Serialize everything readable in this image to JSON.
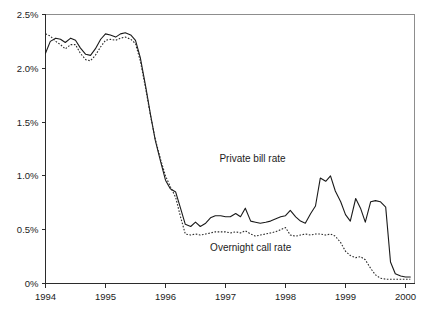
{
  "chart_data": {
    "type": "line",
    "title": "",
    "subtitle": "",
    "xlabel": "",
    "ylabel": "",
    "xlim": [
      1994.0,
      2000.15
    ],
    "ylim": [
      0,
      2.5
    ],
    "grid": false,
    "legend_position": "inline-annotation",
    "y_tick_labels": [
      "2.5%",
      "2.0%",
      "1.5%",
      "1.0%",
      "0.5%",
      "0%"
    ],
    "y_tick_values": [
      2.5,
      2.0,
      1.5,
      1.0,
      0.5,
      0.0
    ],
    "x_tick_labels": [
      "1994",
      "1995",
      "1996",
      "1997",
      "1998",
      "1999",
      "2000"
    ],
    "x_tick_values": [
      1994,
      1995,
      1996,
      1997,
      1998,
      1999,
      2000
    ],
    "annotations": [
      {
        "text": "Private bill rate",
        "x": 1997.45,
        "y": 1.13
      },
      {
        "text": "Overnight call rate",
        "x": 1997.42,
        "y": 0.3
      }
    ],
    "series": [
      {
        "name": "Private bill rate",
        "style": "solid",
        "x": [
          1994.0,
          1994.08,
          1994.17,
          1994.25,
          1994.33,
          1994.42,
          1994.5,
          1994.58,
          1994.67,
          1994.75,
          1994.83,
          1994.92,
          1995.0,
          1995.08,
          1995.17,
          1995.25,
          1995.33,
          1995.42,
          1995.5,
          1995.58,
          1995.67,
          1995.75,
          1995.83,
          1995.92,
          1996.0,
          1996.08,
          1996.17,
          1996.25,
          1996.33,
          1996.42,
          1996.5,
          1996.58,
          1996.67,
          1996.75,
          1996.83,
          1996.92,
          1997.0,
          1997.08,
          1997.17,
          1997.25,
          1997.33,
          1997.42,
          1997.5,
          1997.58,
          1997.67,
          1997.75,
          1997.83,
          1997.92,
          1998.0,
          1998.08,
          1998.17,
          1998.25,
          1998.33,
          1998.42,
          1998.5,
          1998.58,
          1998.67,
          1998.75,
          1998.83,
          1998.92,
          1999.0,
          1999.08,
          1999.17,
          1999.25,
          1999.33,
          1999.42,
          1999.5,
          1999.58,
          1999.67,
          1999.75,
          1999.83,
          1999.92,
          2000.0,
          2000.08
        ],
        "y": [
          2.14,
          2.25,
          2.28,
          2.27,
          2.24,
          2.28,
          2.26,
          2.19,
          2.13,
          2.12,
          2.18,
          2.27,
          2.32,
          2.31,
          2.29,
          2.32,
          2.33,
          2.31,
          2.26,
          2.1,
          1.83,
          1.57,
          1.33,
          1.13,
          0.96,
          0.88,
          0.85,
          0.7,
          0.55,
          0.53,
          0.57,
          0.53,
          0.56,
          0.61,
          0.63,
          0.63,
          0.62,
          0.62,
          0.65,
          0.62,
          0.7,
          0.58,
          0.57,
          0.56,
          0.57,
          0.58,
          0.6,
          0.62,
          0.63,
          0.68,
          0.62,
          0.58,
          0.56,
          0.65,
          0.72,
          0.98,
          0.95,
          1.0,
          0.86,
          0.76,
          0.64,
          0.58,
          0.79,
          0.7,
          0.57,
          0.76,
          0.77,
          0.76,
          0.71,
          0.2,
          0.09,
          0.07,
          0.06,
          0.06
        ]
      },
      {
        "name": "Overnight call rate",
        "style": "dotted",
        "x": [
          1994.0,
          1994.08,
          1994.17,
          1994.25,
          1994.33,
          1994.42,
          1994.5,
          1994.58,
          1994.67,
          1994.75,
          1994.83,
          1994.92,
          1995.0,
          1995.08,
          1995.17,
          1995.25,
          1995.33,
          1995.42,
          1995.5,
          1995.58,
          1995.67,
          1995.75,
          1995.83,
          1995.92,
          1996.0,
          1996.08,
          1996.17,
          1996.25,
          1996.33,
          1996.42,
          1996.5,
          1996.58,
          1996.67,
          1996.75,
          1996.83,
          1996.92,
          1997.0,
          1997.08,
          1997.17,
          1997.25,
          1997.33,
          1997.42,
          1997.5,
          1997.58,
          1997.67,
          1997.75,
          1997.83,
          1997.92,
          1998.0,
          1998.08,
          1998.17,
          1998.25,
          1998.33,
          1998.42,
          1998.5,
          1998.58,
          1998.67,
          1998.75,
          1998.83,
          1998.92,
          1999.0,
          1999.08,
          1999.17,
          1999.25,
          1999.33,
          1999.42,
          1999.5,
          1999.58,
          1999.67,
          1999.75,
          1999.83,
          1999.92,
          2000.0,
          2000.08
        ],
        "y": [
          2.32,
          2.3,
          2.25,
          2.22,
          2.18,
          2.22,
          2.22,
          2.14,
          2.08,
          2.07,
          2.12,
          2.2,
          2.26,
          2.27,
          2.26,
          2.28,
          2.29,
          2.27,
          2.23,
          2.07,
          1.81,
          1.56,
          1.34,
          1.15,
          1.0,
          0.9,
          0.8,
          0.62,
          0.46,
          0.45,
          0.46,
          0.45,
          0.46,
          0.47,
          0.48,
          0.48,
          0.48,
          0.47,
          0.48,
          0.47,
          0.49,
          0.46,
          0.44,
          0.45,
          0.46,
          0.47,
          0.48,
          0.5,
          0.52,
          0.45,
          0.44,
          0.45,
          0.46,
          0.45,
          0.46,
          0.46,
          0.45,
          0.46,
          0.44,
          0.38,
          0.3,
          0.26,
          0.24,
          0.25,
          0.22,
          0.14,
          0.08,
          0.05,
          0.04,
          0.04,
          0.04,
          0.04,
          0.04,
          0.04
        ]
      }
    ]
  },
  "colors": {
    "background": "#ffffff",
    "axis": "#2b2b2b",
    "frame": "#8d8d8d",
    "series_solid": "#1a1a1a",
    "series_dotted": "#2a2a2a",
    "text": "#1c1c1c"
  }
}
